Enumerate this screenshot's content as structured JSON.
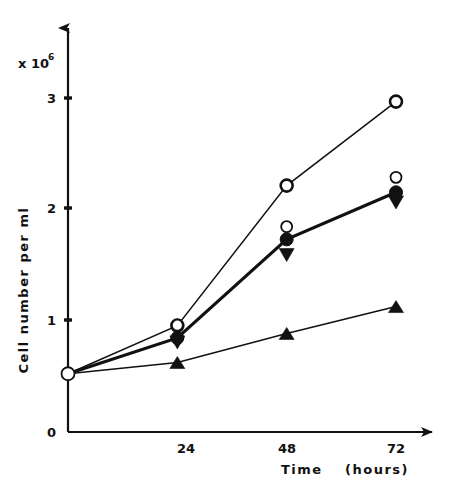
{
  "chart_data": {
    "type": "line",
    "title": "",
    "xlabel": "Time",
    "xlabel_unit": "(hours)",
    "ylabel": "Cell  number  per  ml",
    "y_multiplier_base": "x 10",
    "y_multiplier_exp": "6",
    "x": [
      0,
      24,
      48,
      72
    ],
    "categories": [
      "0",
      "24",
      "48",
      "72"
    ],
    "xlim": [
      0,
      80
    ],
    "ylim": [
      0,
      3.45
    ],
    "xticks": [
      24,
      48,
      72
    ],
    "xtick_labels": [
      "24",
      "48",
      "72"
    ],
    "yticks": [
      0,
      1,
      2,
      3
    ],
    "ytick_labels": [
      "0",
      "1",
      "2",
      "3"
    ],
    "grid": false,
    "legend": "none",
    "y_units": "cells per ml (x 10^6)",
    "series": [
      {
        "name": "open-circle-upper",
        "marker": "open-circle",
        "line_weight": "thin",
        "values": [
          0.52,
          0.95,
          2.2,
          2.95
        ]
      },
      {
        "name": "open-circle-lower",
        "marker": "open-circle-small",
        "line_weight": "none",
        "values": [
          0.52,
          0.9,
          1.78,
          2.22
        ]
      },
      {
        "name": "filled-circle",
        "marker": "filled-circle",
        "line_weight": "thick",
        "values": [
          0.52,
          0.84,
          1.72,
          2.14
        ]
      },
      {
        "name": "filled-down-triangle",
        "marker": "filled-down-triangle",
        "line_weight": "none",
        "values": [
          0.52,
          0.8,
          1.58,
          2.05
        ]
      },
      {
        "name": "filled-up-triangle",
        "marker": "filled-up-triangle",
        "line_weight": "thin",
        "values": [
          0.52,
          0.62,
          0.88,
          1.12
        ]
      }
    ]
  }
}
